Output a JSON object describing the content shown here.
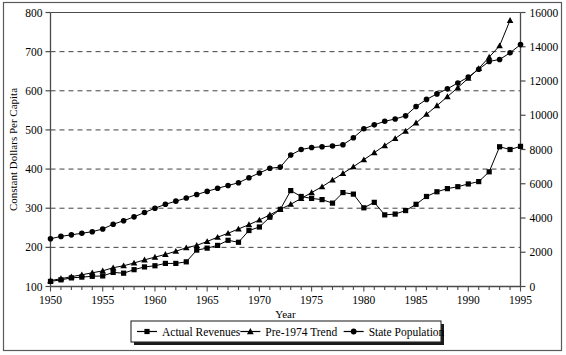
{
  "chart_data": {
    "type": "line",
    "title": "",
    "xlabel": "Year",
    "ylabel": "Constant Dollars Per Capita",
    "ylabel_right": "",
    "xlim": [
      1950,
      1995
    ],
    "ylim": [
      100,
      800
    ],
    "ylim_right": [
      0,
      16000
    ],
    "grid": true,
    "grid_style": "dashed-horizontal",
    "legend_position": "bottom-center",
    "x_tick_labels": [
      "1950",
      "1955",
      "1960",
      "1965",
      "1970",
      "1975",
      "1980",
      "1985",
      "1990",
      "1995"
    ],
    "x_tick_values": [
      1950,
      1955,
      1960,
      1965,
      1970,
      1975,
      1980,
      1985,
      1990,
      1995
    ],
    "x_minor_tick_interval": 1,
    "y_tick_labels": [
      "100",
      "200",
      "300",
      "400",
      "500",
      "600",
      "700",
      "800"
    ],
    "y_tick_values": [
      100,
      200,
      300,
      400,
      500,
      600,
      700,
      800
    ],
    "y_right_tick_labels": [
      "0",
      "2000",
      "4000",
      "6000",
      "8000",
      "10000",
      "12000",
      "14000",
      "16000"
    ],
    "y_right_tick_values": [
      0,
      2000,
      4000,
      6000,
      8000,
      10000,
      12000,
      14000,
      16000
    ],
    "x": [
      1950,
      1951,
      1952,
      1953,
      1954,
      1955,
      1956,
      1957,
      1958,
      1959,
      1960,
      1961,
      1962,
      1963,
      1964,
      1965,
      1966,
      1967,
      1968,
      1969,
      1970,
      1971,
      1972,
      1973,
      1974,
      1975,
      1976,
      1977,
      1978,
      1979,
      1980,
      1981,
      1982,
      1983,
      1984,
      1985,
      1986,
      1987,
      1988,
      1989,
      1990,
      1991,
      1992,
      1993,
      1994,
      1995
    ],
    "series": [
      {
        "name": "Actual Revenues",
        "marker": "square",
        "axis": "left",
        "color": "#000000",
        "values": [
          113,
          117,
          122,
          124,
          126,
          127,
          136,
          134,
          143,
          150,
          153,
          159,
          159,
          163,
          193,
          198,
          205,
          218,
          213,
          243,
          252,
          277,
          297,
          345,
          330,
          325,
          322,
          313,
          340,
          336,
          301,
          315,
          283,
          285,
          294,
          310,
          330,
          342,
          350,
          355,
          362,
          368,
          393,
          457,
          450,
          458
        ]
      },
      {
        "name": "Pre-1974 Trend",
        "marker": "triangle",
        "axis": "left",
        "color": "#000000",
        "values": [
          115,
          120,
          125,
          130,
          135,
          140,
          148,
          153,
          160,
          168,
          175,
          182,
          190,
          199,
          205,
          215,
          226,
          236,
          247,
          258,
          270,
          283,
          297,
          310,
          325,
          340,
          355,
          372,
          389,
          406,
          424,
          442,
          460,
          478,
          497,
          518,
          540,
          562,
          585,
          608,
          632,
          657,
          686,
          715,
          780,
          null
        ]
      },
      {
        "name": "State Population",
        "marker": "circle",
        "axis": "left",
        "color": "#000000",
        "values": [
          222,
          228,
          232,
          236,
          240,
          247,
          259,
          268,
          278,
          289,
          300,
          310,
          318,
          326,
          335,
          343,
          351,
          358,
          365,
          378,
          390,
          402,
          405,
          436,
          450,
          455,
          457,
          459,
          462,
          480,
          503,
          513,
          522,
          528,
          536,
          560,
          578,
          592,
          605,
          620,
          635,
          655,
          675,
          680,
          697,
          718
        ]
      }
    ],
    "series_right_equivalent_note": "Right axis 0-16000 maps linearly: value_right = (value_left - 100) * 16000/700 ... secondary scale shown for State Population"
  },
  "legend": {
    "entries": [
      {
        "label": "Actual Revenues",
        "marker": "square"
      },
      {
        "label": "Pre-1974 Trend",
        "marker": "triangle"
      },
      {
        "label": "State Population",
        "marker": "circle"
      }
    ]
  },
  "colors": {
    "ink": "#000000",
    "frame": "#4a4a4a",
    "grid": "#333333",
    "background": "#ffffff"
  }
}
